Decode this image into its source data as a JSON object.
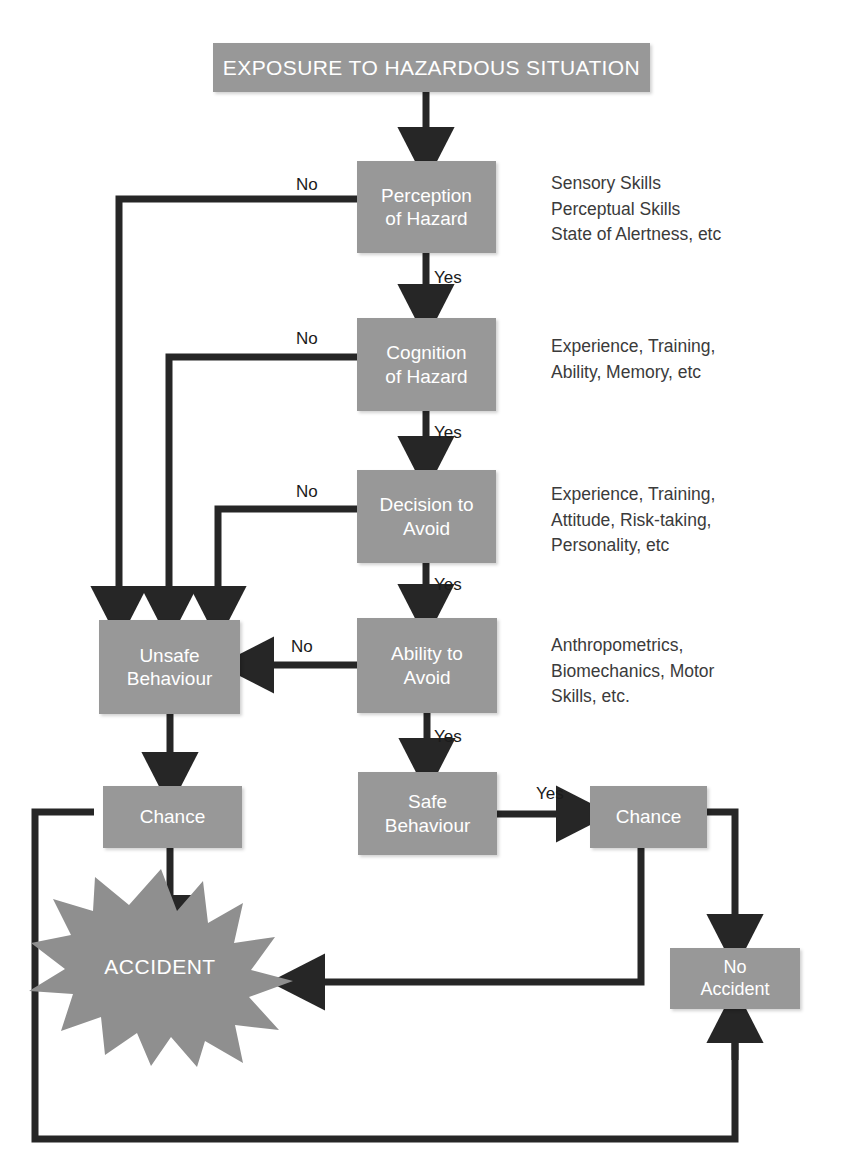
{
  "diagram": {
    "colors": {
      "node_fill": "#989898",
      "node_text": "#ffffff",
      "edge": "#262626",
      "note_text": "#3b3b3b",
      "background": "#ffffff"
    },
    "nodes": [
      {
        "id": "exposure",
        "label": "EXPOSURE TO HAZARDOUS SITUATION",
        "x": 213,
        "y": 43,
        "w": 437,
        "h": 49,
        "style": "banner"
      },
      {
        "id": "perception",
        "label": "Perception\nof Hazard",
        "x": 357,
        "y": 161,
        "w": 139,
        "h": 92,
        "style": "proc"
      },
      {
        "id": "cognition",
        "label": "Cognition\nof Hazard",
        "x": 357,
        "y": 318,
        "w": 139,
        "h": 93,
        "style": "proc"
      },
      {
        "id": "decision",
        "label": "Decision to\nAvoid",
        "x": 357,
        "y": 470,
        "w": 139,
        "h": 93,
        "style": "proc"
      },
      {
        "id": "ability",
        "label": "Ability to\nAvoid",
        "x": 357,
        "y": 618,
        "w": 140,
        "h": 95,
        "style": "proc"
      },
      {
        "id": "unsafe",
        "label": "Unsafe\nBehaviour",
        "x": 99,
        "y": 620,
        "w": 141,
        "h": 94,
        "style": "proc"
      },
      {
        "id": "chance-left",
        "label": "Chance",
        "x": 103,
        "y": 786,
        "w": 139,
        "h": 62,
        "style": "proc"
      },
      {
        "id": "safe",
        "label": "Safe\nBehaviour",
        "x": 358,
        "y": 772,
        "w": 139,
        "h": 83,
        "style": "proc"
      },
      {
        "id": "chance-right",
        "label": "Chance",
        "x": 590,
        "y": 786,
        "w": 117,
        "h": 62,
        "style": "proc"
      },
      {
        "id": "no-accident",
        "label": "No\nAccident",
        "x": 670,
        "y": 948,
        "w": 130,
        "h": 61,
        "style": "small"
      }
    ],
    "burst": {
      "id": "accident",
      "label": "ACCIDENT",
      "cx": 160,
      "cy": 967,
      "rx": 135,
      "ry": 100
    },
    "notes": [
      {
        "id": "note-perception",
        "text": "Sensory Skills\nPerceptual Skills\nState of Alertness, etc",
        "x": 551,
        "y": 171
      },
      {
        "id": "note-cognition",
        "text": "Experience, Training,\nAbility, Memory, etc",
        "x": 551,
        "y": 334
      },
      {
        "id": "note-decision",
        "text": "Experience, Training,\nAttitude, Risk-taking,\nPersonality, etc",
        "x": 551,
        "y": 482
      },
      {
        "id": "note-ability",
        "text": "Anthropometrics,\nBiomechanics, Motor\nSkills, etc.",
        "x": 551,
        "y": 633
      }
    ],
    "edge_labels": [
      {
        "id": "no-perception",
        "text": "No",
        "x": 296,
        "y": 175
      },
      {
        "id": "yes-perception",
        "text": "Yes",
        "x": 434,
        "y": 268
      },
      {
        "id": "no-cognition",
        "text": "No",
        "x": 296,
        "y": 329
      },
      {
        "id": "yes-cognition",
        "text": "Yes",
        "x": 434,
        "y": 423
      },
      {
        "id": "no-decision",
        "text": "No",
        "x": 296,
        "y": 482
      },
      {
        "id": "yes-decision",
        "text": "Yes",
        "x": 434,
        "y": 575
      },
      {
        "id": "no-ability",
        "text": "No",
        "x": 291,
        "y": 637
      },
      {
        "id": "yes-ability",
        "text": "Yes",
        "x": 434,
        "y": 727
      },
      {
        "id": "yes-safe",
        "text": "Yes",
        "x": 536,
        "y": 784
      }
    ]
  }
}
